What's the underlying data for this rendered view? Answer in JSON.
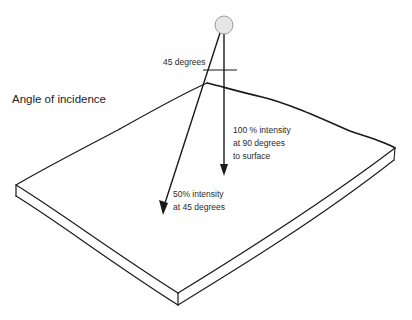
{
  "diagram": {
    "title": "Angle of incidence",
    "labels": {
      "angle": "45 degrees",
      "vertical_line1": "100 % intensity",
      "vertical_line2": "at 90 degrees",
      "vertical_line3": "to surface",
      "angled_line1": "50% intensity",
      "angled_line2": "at 45 degrees"
    },
    "elements": {
      "light_source": "light-source-circle",
      "surface": "sketched-slab",
      "rays": [
        "vertical-ray-90-degrees",
        "angled-ray-45-degrees"
      ]
    },
    "colors": {
      "stroke": "#1a1a1a",
      "light_fill": "#e6e6e6",
      "light_stroke": "#9a9a9a",
      "text": "#333333"
    }
  }
}
